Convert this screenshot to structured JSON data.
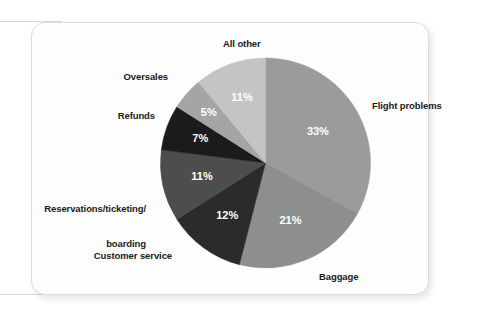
{
  "figure": {
    "background_color": "#ffffff",
    "card_background": "#fdfdfd",
    "card_border_color": "#dcdcdc"
  },
  "chart_data": {
    "type": "pie",
    "title": "",
    "subtitle": "",
    "xlabel": "",
    "ylabel": "",
    "legend_position": "none",
    "labels_position": "outside-callout-text",
    "value_labels_inside": true,
    "value_suffix": "%",
    "start_angle_deg": 0,
    "direction": "clockwise",
    "categories": [
      "Flight problems",
      "Baggage",
      "Customer service",
      "Reservations/ticketing/\nboarding",
      "Refunds",
      "Oversales",
      "All other"
    ],
    "values": [
      33,
      21,
      12,
      11,
      7,
      5,
      11
    ],
    "value_text": [
      "33%",
      "21%",
      "12%",
      "11%",
      "7%",
      "5%",
      "11%"
    ],
    "colors": [
      "#9a9b9b",
      "#8d8e8e",
      "#2b2b2b",
      "#4d4d4d",
      "#1b1b1b",
      "#a4a5a5",
      "#c3c4c4"
    ],
    "total": 100,
    "slices": [
      {
        "label": "Flight problems",
        "value": 33,
        "value_text": "33%",
        "color": "#9a9b9b"
      },
      {
        "label": "Baggage",
        "value": 21,
        "value_text": "21%",
        "color": "#8d8e8e"
      },
      {
        "label": "Customer service",
        "value": 12,
        "value_text": "12%",
        "color": "#2b2b2b"
      },
      {
        "label": "Reservations/ticketing/boarding",
        "value": 11,
        "value_text": "11%",
        "color": "#4d4d4d"
      },
      {
        "label": "Refunds",
        "value": 7,
        "value_text": "7%",
        "color": "#1b1b1b"
      },
      {
        "label": "Oversales",
        "value": 5,
        "value_text": "5%",
        "color": "#a4a5a5"
      },
      {
        "label": "All other",
        "value": 11,
        "value_text": "11%",
        "color": "#c3c4c4"
      }
    ]
  },
  "labels": {
    "all_other": "All other",
    "oversales": "Oversales",
    "refunds": "Refunds",
    "reservations_line1": "Reservations/ticketing/",
    "reservations_line2": "boarding",
    "customer_service": "Customer service",
    "baggage": "Baggage",
    "flight_problems": "Flight problems"
  }
}
